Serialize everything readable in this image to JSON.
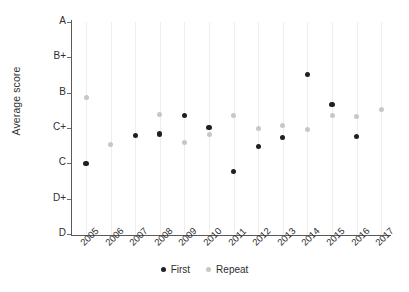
{
  "chart_data": {
    "type": "scatter",
    "title": "",
    "xlabel": "",
    "ylabel": "Average score",
    "categories": [
      "2005",
      "2006",
      "2007",
      "2008",
      "2009",
      "2010",
      "2011",
      "2012",
      "2013",
      "2014",
      "2015",
      "2016",
      "2017"
    ],
    "ytick_labels": [
      "A",
      "B+",
      "B",
      "C+",
      "C",
      "D+",
      "D"
    ],
    "yscale_values": [
      6,
      5,
      4,
      3,
      2,
      1,
      0
    ],
    "ylim": [
      0,
      6
    ],
    "grid": "vertical",
    "legend_position": "bottom",
    "series": [
      {
        "name": "First",
        "color": "#1f1f24",
        "values": [
          2.0,
          null,
          2.78,
          2.83,
          3.35,
          3.02,
          1.78,
          2.48,
          2.72,
          4.52,
          3.67,
          2.75,
          null
        ]
      },
      {
        "name": "Repeat",
        "color": "#c7c7c7",
        "values": [
          3.85,
          2.52,
          null,
          3.39,
          2.6,
          2.83,
          3.35,
          3.0,
          3.07,
          2.95,
          3.35,
          3.32,
          3.51
        ]
      }
    ]
  },
  "legend": {
    "entries": [
      {
        "label": "First",
        "color": "#1f1f24"
      },
      {
        "label": "Repeat",
        "color": "#c7c7c7"
      }
    ]
  }
}
